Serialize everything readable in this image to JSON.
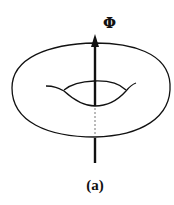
{
  "figure": {
    "type": "torus-with-flux-diagram",
    "flux_label": "Φ",
    "caption": "(a)",
    "colors": {
      "stroke": "#111111",
      "background": "#ffffff"
    }
  }
}
